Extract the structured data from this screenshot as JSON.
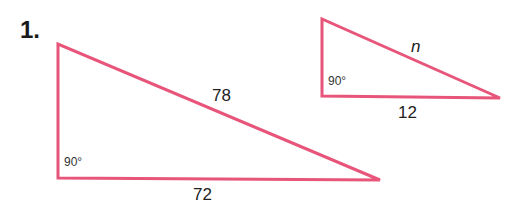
{
  "problem": {
    "number": "1."
  },
  "colors": {
    "stroke": "#e8557a",
    "text": "#222222"
  },
  "triangles": [
    {
      "id": "large",
      "vertices": [
        [
          58,
          44
        ],
        [
          58,
          178
        ],
        [
          380,
          180
        ]
      ],
      "labels": {
        "hypotenuse": "78",
        "base": "72",
        "right_angle": "90°"
      }
    },
    {
      "id": "small",
      "vertices": [
        [
          322,
          19
        ],
        [
          322,
          96
        ],
        [
          500,
          98
        ]
      ],
      "labels": {
        "hypotenuse": "n",
        "base": "12",
        "right_angle": "90°"
      }
    }
  ]
}
